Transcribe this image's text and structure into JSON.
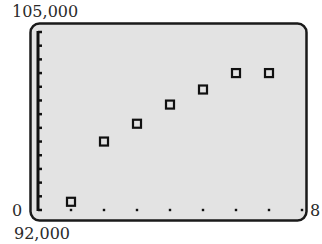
{
  "chart_data": {
    "type": "scatter",
    "title": "",
    "xlabel": "",
    "ylabel": "",
    "xlim": [
      0,
      8
    ],
    "ylim": [
      92000,
      105000
    ],
    "x_scale": 1,
    "y_scale": 1000,
    "grid": false,
    "legend": null,
    "marker": "open-square",
    "points": [
      {
        "x": 1,
        "y": 92600
      },
      {
        "x": 2,
        "y": 97000
      },
      {
        "x": 3,
        "y": 98300
      },
      {
        "x": 4,
        "y": 99700
      },
      {
        "x": 5,
        "y": 100800
      },
      {
        "x": 6,
        "y": 102000
      },
      {
        "x": 7,
        "y": 102000
      }
    ]
  },
  "labels": {
    "ymax": "105,000",
    "ymin": "92,000",
    "xmin": "0",
    "xmax": "8"
  },
  "colors": {
    "screen_bg": "#e3e3e3",
    "frame": "#1a1a1a",
    "marker": "#111111"
  }
}
